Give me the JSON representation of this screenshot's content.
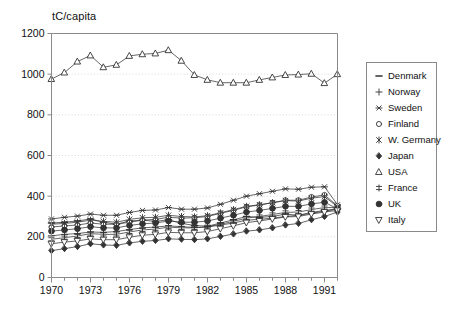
{
  "chart_data": {
    "type": "line",
    "title": "",
    "subtitle": "",
    "ylabel": "tC/capita",
    "xlabel": "",
    "ylim": [
      0,
      1200
    ],
    "xlim": [
      1970,
      1992
    ],
    "ytick_values": [
      0,
      200,
      400,
      600,
      800,
      1000,
      1200
    ],
    "ytick_labels": [
      "0",
      "200",
      "400",
      "600",
      "800",
      "1000",
      "1200"
    ],
    "xtick_values": [
      1970,
      1973,
      1976,
      1979,
      1982,
      1985,
      1988,
      1991
    ],
    "xtick_labels": [
      "1970",
      "1973",
      "1976",
      "1979",
      "1982",
      "1985",
      "1988",
      "1991"
    ],
    "xtick_minor_step": 1,
    "grid": "horizontal-dotted",
    "legend_position": "right-outside",
    "x": [
      1970,
      1971,
      1972,
      1973,
      1974,
      1975,
      1976,
      1977,
      1978,
      1979,
      1980,
      1981,
      1982,
      1983,
      1984,
      1985,
      1986,
      1987,
      1988,
      1989,
      1990,
      1991,
      1992
    ],
    "series": [
      {
        "name": "Denmark",
        "marker": "dash",
        "filled": false,
        "values": [
          268,
          272,
          278,
          288,
          272,
          262,
          278,
          282,
          276,
          284,
          266,
          256,
          252,
          268,
          284,
          300,
          296,
          300,
          312,
          306,
          320,
          330,
          338
        ]
      },
      {
        "name": "Norway",
        "marker": "plus",
        "filled": false,
        "values": [
          205,
          212,
          216,
          224,
          222,
          226,
          236,
          244,
          248,
          254,
          250,
          246,
          248,
          258,
          268,
          282,
          286,
          292,
          300,
          306,
          316,
          326,
          336
        ]
      },
      {
        "name": "Sweden",
        "marker": "asterisk",
        "filled": false,
        "values": [
          288,
          296,
          302,
          312,
          306,
          306,
          320,
          330,
          332,
          344,
          336,
          336,
          342,
          360,
          380,
          400,
          412,
          424,
          436,
          434,
          444,
          446,
          358
        ]
      },
      {
        "name": "Finland",
        "marker": "open-circle",
        "filled": false,
        "values": [
          248,
          254,
          258,
          268,
          262,
          262,
          272,
          282,
          286,
          296,
          292,
          294,
          300,
          316,
          330,
          348,
          356,
          368,
          380,
          380,
          396,
          406,
          352
        ]
      },
      {
        "name": "W. Germany",
        "marker": "x-star",
        "filled": false,
        "values": [
          262,
          266,
          272,
          282,
          276,
          272,
          286,
          294,
          296,
          306,
          300,
          298,
          304,
          318,
          334,
          350,
          358,
          368,
          378,
          376,
          390,
          398,
          348
        ]
      },
      {
        "name": "Japan",
        "marker": "filled-diamond",
        "filled": true,
        "values": [
          132,
          142,
          152,
          166,
          160,
          158,
          170,
          178,
          182,
          190,
          188,
          186,
          190,
          202,
          214,
          228,
          234,
          244,
          258,
          266,
          284,
          300,
          322
        ]
      },
      {
        "name": "USA",
        "marker": "open-triangle-up",
        "filled": false,
        "values": [
          976,
          1008,
          1062,
          1092,
          1034,
          1046,
          1090,
          1098,
          1102,
          1118,
          1066,
          996,
          972,
          958,
          958,
          958,
          972,
          984,
          996,
          998,
          1002,
          956,
          1000
        ]
      },
      {
        "name": "France",
        "marker": "double-dagger",
        "filled": false,
        "values": [
          188,
          196,
          204,
          216,
          212,
          212,
          224,
          234,
          238,
          248,
          244,
          244,
          250,
          262,
          276,
          292,
          300,
          310,
          320,
          322,
          334,
          344,
          344
        ]
      },
      {
        "name": "UK",
        "marker": "filled-circle",
        "filled": true,
        "values": [
          228,
          234,
          240,
          250,
          244,
          244,
          256,
          264,
          268,
          278,
          272,
          272,
          278,
          292,
          306,
          322,
          330,
          340,
          350,
          350,
          362,
          370,
          338
        ]
      },
      {
        "name": "Italy",
        "marker": "open-triangle-down",
        "filled": false,
        "values": [
          166,
          174,
          180,
          190,
          186,
          186,
          198,
          208,
          212,
          222,
          220,
          220,
          226,
          240,
          254,
          270,
          278,
          288,
          298,
          300,
          312,
          322,
          330
        ]
      }
    ]
  },
  "legend": {
    "items": [
      {
        "label": "Denmark",
        "marker": "dash"
      },
      {
        "label": "Norway",
        "marker": "plus"
      },
      {
        "label": "Sweden",
        "marker": "asterisk"
      },
      {
        "label": "Finland",
        "marker": "open-circle"
      },
      {
        "label": "W. Germany",
        "marker": "x-star"
      },
      {
        "label": "Japan",
        "marker": "filled-diamond"
      },
      {
        "label": "USA",
        "marker": "open-triangle-up"
      },
      {
        "label": "France",
        "marker": "double-dagger"
      },
      {
        "label": "UK",
        "marker": "filled-circle"
      },
      {
        "label": "Italy",
        "marker": "open-triangle-down"
      }
    ]
  },
  "colors": {
    "line": "#333333",
    "axis": "#8a8a8a",
    "grid": "#cfcfcf",
    "text": "#111111",
    "background": "#ffffff"
  }
}
